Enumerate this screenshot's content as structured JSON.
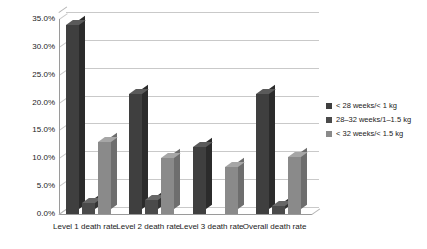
{
  "chart_data": {
    "type": "bar",
    "title": "",
    "xlabel": "",
    "ylabel": "",
    "ylim": [
      0,
      35
    ],
    "ytick_labels": [
      "0.0%",
      "5.0%",
      "10.0%",
      "15.0%",
      "20.0%",
      "25.0%",
      "30.0%",
      "35.0%"
    ],
    "ytick_values": [
      0,
      5,
      10,
      15,
      20,
      25,
      30,
      35
    ],
    "grid": true,
    "legend_position": "right",
    "categories": [
      "Level 1 death rate",
      "Level 2 death rate",
      "Level 3 death rate",
      "Overall death rate"
    ],
    "series": [
      {
        "name": "< 28 weeks/< 1 kg",
        "color": "#3f3f3f",
        "values": [
          34.0,
          21.5,
          12.0,
          21.5
        ]
      },
      {
        "name": "28–32 weeks/1–1.5 kg",
        "color": "#4a4a4a",
        "values": [
          2.0,
          2.5,
          0.0,
          1.5
        ]
      },
      {
        "name": "< 32 weeks/< 1.5 kg",
        "color": "#8a8a8a",
        "values": [
          13.0,
          10.0,
          8.5,
          10.3
        ]
      }
    ]
  }
}
